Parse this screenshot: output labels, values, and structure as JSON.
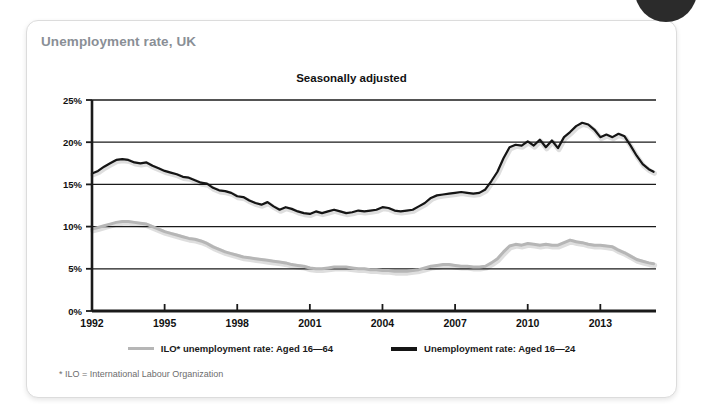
{
  "card": {
    "title": "Unemployment rate, UK",
    "footnote": "* ILO = International Labour Organization"
  },
  "chart_data": {
    "type": "line",
    "title": "Seasonally adjusted",
    "subtitle": "Unemployment rate, UK",
    "xlabel": "",
    "ylabel": "",
    "xlim": [
      1992,
      2015.3
    ],
    "ylim": [
      0,
      25
    ],
    "grid": true,
    "grid_axis": "y",
    "legend_position": "bottom",
    "xticks": [
      1992,
      1995,
      1998,
      2001,
      2004,
      2007,
      2010,
      2013
    ],
    "xtick_labels": [
      "1992",
      "1995",
      "1998",
      "2001",
      "2004",
      "2007",
      "2010",
      "2013"
    ],
    "yticks": [
      0,
      5,
      10,
      15,
      20,
      25
    ],
    "ytick_labels": [
      "0%",
      "5%",
      "10%",
      "15%",
      "20%",
      "25%"
    ],
    "annotations": [
      "* ILO = International Labour Organization"
    ],
    "series": [
      {
        "name": "ILO* unemployment rate: Aged 16—64",
        "color": "#b6b6b6",
        "x": [
          1992.0,
          1992.25,
          1992.5,
          1992.75,
          1993.0,
          1993.25,
          1993.5,
          1993.75,
          1994.0,
          1994.25,
          1994.5,
          1994.75,
          1995.0,
          1995.25,
          1995.5,
          1995.75,
          1996.0,
          1996.25,
          1996.5,
          1996.75,
          1997.0,
          1997.25,
          1997.5,
          1997.75,
          1998.0,
          1998.25,
          1998.5,
          1998.75,
          1999.0,
          1999.25,
          1999.5,
          1999.75,
          2000.0,
          2000.25,
          2000.5,
          2000.75,
          2001.0,
          2001.25,
          2001.5,
          2001.75,
          2002.0,
          2002.25,
          2002.5,
          2002.75,
          2003.0,
          2003.25,
          2003.5,
          2003.75,
          2004.0,
          2004.25,
          2004.5,
          2004.75,
          2005.0,
          2005.25,
          2005.5,
          2005.75,
          2006.0,
          2006.25,
          2006.5,
          2006.75,
          2007.0,
          2007.25,
          2007.5,
          2007.75,
          2008.0,
          2008.25,
          2008.5,
          2008.75,
          2009.0,
          2009.25,
          2009.5,
          2009.75,
          2010.0,
          2010.25,
          2010.5,
          2010.75,
          2011.0,
          2011.25,
          2011.5,
          2011.75,
          2012.0,
          2012.25,
          2012.5,
          2012.75,
          2013.0,
          2013.25,
          2013.5,
          2013.75,
          2014.0,
          2014.25,
          2014.5,
          2014.75,
          2015.0,
          2015.2
        ],
        "y": [
          9.7,
          9.9,
          10.1,
          10.3,
          10.5,
          10.6,
          10.6,
          10.5,
          10.4,
          10.3,
          10.0,
          9.7,
          9.4,
          9.2,
          9.0,
          8.8,
          8.6,
          8.5,
          8.3,
          8.0,
          7.6,
          7.3,
          7.0,
          6.8,
          6.6,
          6.4,
          6.3,
          6.2,
          6.1,
          6.0,
          5.9,
          5.8,
          5.7,
          5.5,
          5.4,
          5.3,
          5.1,
          5.0,
          5.0,
          5.1,
          5.2,
          5.2,
          5.2,
          5.1,
          5.0,
          5.0,
          4.9,
          4.9,
          4.8,
          4.8,
          4.7,
          4.7,
          4.7,
          4.8,
          4.9,
          5.1,
          5.3,
          5.4,
          5.5,
          5.5,
          5.4,
          5.3,
          5.3,
          5.2,
          5.2,
          5.3,
          5.7,
          6.2,
          7.0,
          7.7,
          7.9,
          7.8,
          8.0,
          7.9,
          7.8,
          7.9,
          7.8,
          7.8,
          8.1,
          8.4,
          8.2,
          8.1,
          7.9,
          7.8,
          7.8,
          7.7,
          7.6,
          7.2,
          6.9,
          6.5,
          6.1,
          5.9,
          5.7,
          5.6
        ]
      },
      {
        "name": "Unemployment rate: Aged 16—24",
        "color": "#151515",
        "x": [
          1992.0,
          1992.25,
          1992.5,
          1992.75,
          1993.0,
          1993.25,
          1993.5,
          1993.75,
          1994.0,
          1994.25,
          1994.5,
          1994.75,
          1995.0,
          1995.25,
          1995.5,
          1995.75,
          1996.0,
          1996.25,
          1996.5,
          1996.75,
          1997.0,
          1997.25,
          1997.5,
          1997.75,
          1998.0,
          1998.25,
          1998.5,
          1998.75,
          1999.0,
          1999.25,
          1999.5,
          1999.75,
          2000.0,
          2000.25,
          2000.5,
          2000.75,
          2001.0,
          2001.25,
          2001.5,
          2001.75,
          2002.0,
          2002.25,
          2002.5,
          2002.75,
          2003.0,
          2003.25,
          2003.5,
          2003.75,
          2004.0,
          2004.25,
          2004.5,
          2004.75,
          2005.0,
          2005.25,
          2005.5,
          2005.75,
          2006.0,
          2006.25,
          2006.5,
          2006.75,
          2007.0,
          2007.25,
          2007.5,
          2007.75,
          2008.0,
          2008.25,
          2008.5,
          2008.75,
          2009.0,
          2009.25,
          2009.5,
          2009.75,
          2010.0,
          2010.25,
          2010.5,
          2010.75,
          2011.0,
          2011.25,
          2011.5,
          2011.75,
          2012.0,
          2012.25,
          2012.5,
          2012.75,
          2013.0,
          2013.25,
          2013.5,
          2013.75,
          2014.0,
          2014.25,
          2014.5,
          2014.75,
          2015.0,
          2015.2
        ],
        "y": [
          16.3,
          16.6,
          17.1,
          17.5,
          17.9,
          18.0,
          17.9,
          17.6,
          17.5,
          17.6,
          17.2,
          16.9,
          16.6,
          16.4,
          16.2,
          15.9,
          15.8,
          15.5,
          15.2,
          15.1,
          14.6,
          14.3,
          14.2,
          14.0,
          13.6,
          13.5,
          13.1,
          12.8,
          12.6,
          12.9,
          12.4,
          12.0,
          12.3,
          12.1,
          11.8,
          11.6,
          11.5,
          11.8,
          11.6,
          11.8,
          12.0,
          11.8,
          11.6,
          11.7,
          11.9,
          11.8,
          11.9,
          12.0,
          12.3,
          12.2,
          11.9,
          11.8,
          11.9,
          12.0,
          12.4,
          12.8,
          13.4,
          13.7,
          13.8,
          13.9,
          14.0,
          14.1,
          14.0,
          13.9,
          14.0,
          14.4,
          15.4,
          16.5,
          18.1,
          19.4,
          19.7,
          19.6,
          20.1,
          19.6,
          20.3,
          19.4,
          20.2,
          19.3,
          20.6,
          21.2,
          21.9,
          22.3,
          22.1,
          21.5,
          20.6,
          20.9,
          20.6,
          21.0,
          20.7,
          19.6,
          18.4,
          17.4,
          16.8,
          16.5
        ]
      }
    ]
  },
  "legend": [
    {
      "label": "ILO* unemployment rate: Aged 16—64",
      "swatch": "gray"
    },
    {
      "label": "Unemployment rate: Aged 16—24",
      "swatch": "black"
    }
  ]
}
